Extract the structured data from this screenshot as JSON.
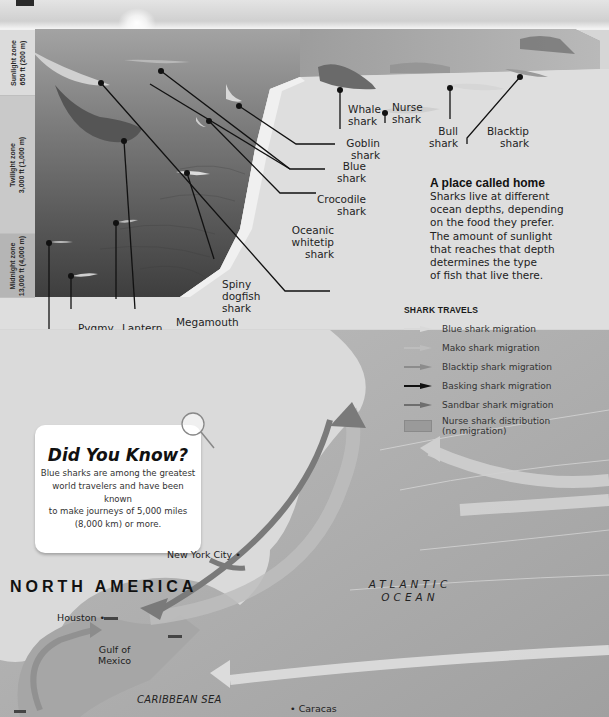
{
  "page": {
    "colors": {
      "ocean_surface": "#9a9a9a",
      "ocean_deep": "#4a4a4a",
      "seafloor": "#e2e2e2",
      "map_sea": "#a8a8a8",
      "map_land": "#dcdcdc",
      "label_text": "#1e1e1e"
    }
  },
  "zones": [
    {
      "name": "Sunlight zone",
      "depth": "650 ft (200 m)"
    },
    {
      "name": "Twilight zone",
      "depth": "3,000 ft (1,000 m)"
    },
    {
      "name": "Midnight zone",
      "depth": "13,000 ft (4,000 m)"
    }
  ],
  "callouts": {
    "whale": {
      "line1": "Whale",
      "line2": "shark"
    },
    "nurse": {
      "line1": "Nurse",
      "line2": "shark"
    },
    "bull": {
      "line1": "Bull",
      "line2": "shark"
    },
    "blacktip": {
      "line1": "Blacktip",
      "line2": "shark"
    },
    "goblin": {
      "line1": "Goblin",
      "line2": "shark"
    },
    "blue": {
      "line1": "Blue",
      "line2": "shark"
    },
    "crocodile": {
      "line1": "Crocodile",
      "line2": "shark"
    },
    "oceanic": {
      "line1": "Oceanic",
      "line2": "whitetip",
      "line3": "shark"
    },
    "spiny": {
      "line1": "Spiny",
      "line2": "dogfish",
      "line3": "shark"
    },
    "megamouth": {
      "line1": "Megamouth",
      "line2": "shark"
    },
    "lantern": {
      "line1": "Lantern",
      "line2": "shark"
    },
    "pygmy": {
      "line1": "Pygmy",
      "line2": "shark"
    },
    "cookiecutter": {
      "line1": "Cookiecutter",
      "line2": "shark"
    }
  },
  "intro": {
    "title": "A place called home",
    "lines": [
      "Sharks live at different",
      "ocean depths, depending",
      "on the food they prefer.",
      "The amount of sunlight",
      "that reaches that depth",
      "determines the type",
      "of fish that live there."
    ]
  },
  "legend": {
    "title": "SHARK TRAVELS",
    "items": [
      {
        "label": "Blue shark migration",
        "color": "#d9d9d9",
        "type": "arrow"
      },
      {
        "label": "Mako shark migration",
        "color": "#bdbdbd",
        "type": "arrow"
      },
      {
        "label": "Blacktip shark migration",
        "color": "#8c8c8c",
        "type": "arrow"
      },
      {
        "label": "Basking shark migration",
        "color": "#111111",
        "type": "arrow"
      },
      {
        "label": "Sandbar shark migration",
        "color": "#6e6e6e",
        "type": "arrow"
      },
      {
        "label": "Nurse shark distribution",
        "label2": "(no migration)",
        "color": "#9a9a9a",
        "type": "box"
      }
    ]
  },
  "did_you_know": {
    "title": "Did You Know?",
    "lines": [
      "Blue sharks are among the greatest",
      "world travelers and have been known",
      "to make journeys of 5,000 miles",
      "(8,000 km) or more."
    ]
  },
  "map": {
    "continent": "NORTH AMERICA",
    "ocean_line1": "ATLANTIC",
    "ocean_line2": "OCEAN",
    "sea": "CARIBBEAN SEA",
    "gulf_line1": "Gulf of",
    "gulf_line2": "Mexico",
    "cities": [
      {
        "name": "New York City"
      },
      {
        "name": "Houston"
      },
      {
        "name": "Caracas"
      }
    ]
  }
}
